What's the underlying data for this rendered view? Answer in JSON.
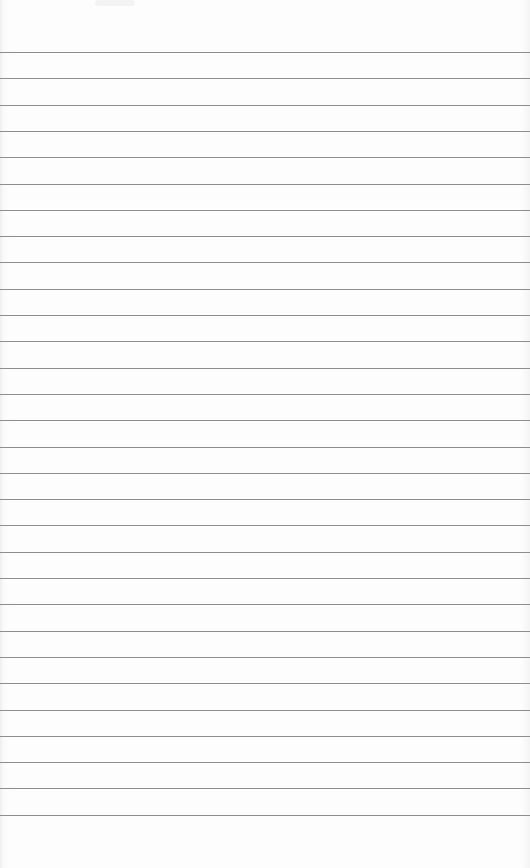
{
  "paper": {
    "type": "ruled-notebook-page",
    "background_color": "#fdfdfd",
    "line_color": "#8e8e8e",
    "line_count": 30,
    "first_line_y": 52,
    "line_spacing": 26.3,
    "content": []
  }
}
